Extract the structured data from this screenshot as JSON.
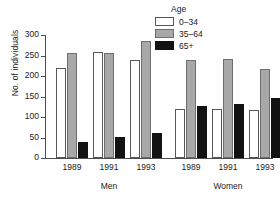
{
  "chart_data": {
    "type": "bar",
    "title": "",
    "xlabel": "",
    "ylabel": "No. of individuals",
    "ylim": [
      0,
      300
    ],
    "yticks": [
      0,
      50,
      100,
      150,
      200,
      250,
      300
    ],
    "grid": false,
    "legend_title": "Age",
    "legend_position": "top-right",
    "groups": [
      "Men",
      "Women"
    ],
    "categories": [
      "1989",
      "1991",
      "1993",
      "1989",
      "1991",
      "1993"
    ],
    "series": [
      {
        "name": "0–34",
        "color": "#ffffff",
        "values": [
          220,
          258,
          238,
          120,
          119,
          116
        ]
      },
      {
        "name": "35–64",
        "color": "#a8a8a8",
        "values": [
          255,
          257,
          285,
          240,
          241,
          217
        ]
      },
      {
        "name": "65+",
        "color": "#121212",
        "values": [
          39,
          52,
          61,
          128,
          131,
          147
        ]
      }
    ]
  },
  "axes": {
    "y_title": "No. of individuals",
    "y_tick_labels": [
      "0",
      "50",
      "100",
      "150",
      "200",
      "250",
      "300"
    ],
    "x_tick_labels": [
      "1989",
      "1991",
      "1993",
      "1989",
      "1991",
      "1993"
    ],
    "group_labels": [
      "Men",
      "Women"
    ]
  },
  "legend": {
    "title": "Age",
    "entries": [
      {
        "label": "0–34",
        "swatch": "white-swatch"
      },
      {
        "label": "35–64",
        "swatch": "gray-swatch"
      },
      {
        "label": "65+",
        "swatch": "black-swatch"
      }
    ]
  }
}
